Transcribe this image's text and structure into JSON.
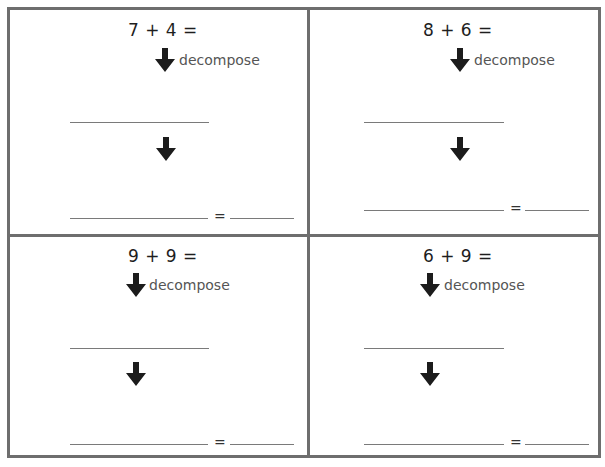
{
  "worksheet": {
    "border_color": "#6e6e6e",
    "decompose_label": "decompose",
    "equals_sign": "=",
    "problems": [
      {
        "position": "top-left",
        "equation": "7 + 4 ="
      },
      {
        "position": "top-right",
        "equation": "8 + 6 ="
      },
      {
        "position": "bottom-left",
        "equation": "9 + 9 ="
      },
      {
        "position": "bottom-right",
        "equation": "6 + 9 ="
      }
    ]
  }
}
